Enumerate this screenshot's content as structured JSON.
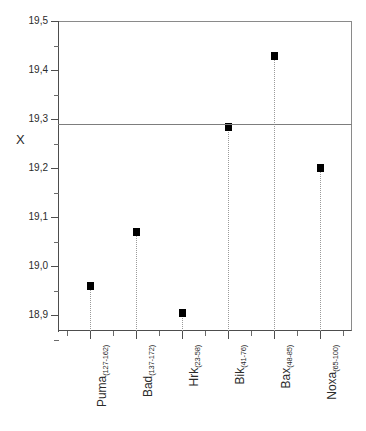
{
  "chart_data": {
    "type": "scatter",
    "title": "",
    "xlabel": "",
    "ylabel": "X",
    "ylim": [
      18.85,
      19.5
    ],
    "grid": false,
    "legend": null,
    "decimal_separator": ",",
    "categories": [
      "Puma(127-162)",
      "Bad(137-172)",
      "Hrk(23-58)",
      "Bik(41-76)",
      "Bax(48-85)",
      "Noxa(65-100)"
    ],
    "category_parts": [
      {
        "base": "Puma",
        "sub": "(127-162)"
      },
      {
        "base": "Bad",
        "sub": "(137-172)"
      },
      {
        "base": "Hrk",
        "sub": "(23-58)"
      },
      {
        "base": "Bik",
        "sub": "(41-76)"
      },
      {
        "base": "Bax",
        "sub": "(48-85)"
      },
      {
        "base": "Noxa",
        "sub": "(65-100)"
      }
    ],
    "values": [
      18.96,
      19.07,
      18.905,
      19.283,
      19.428,
      19.2
    ],
    "reference_line": {
      "value": 19.29,
      "style": "solid",
      "color": "#7d7d7d"
    },
    "y_ticks": [
      "19,5",
      "19,4",
      "19,3",
      "19,2",
      "19,1",
      "19,0",
      "18,9"
    ],
    "y_tick_values": [
      19.5,
      19.4,
      19.3,
      19.2,
      19.1,
      19.0,
      18.9
    ],
    "marker_style": "filled-square",
    "marker_color": "#000000",
    "droplines": true
  }
}
